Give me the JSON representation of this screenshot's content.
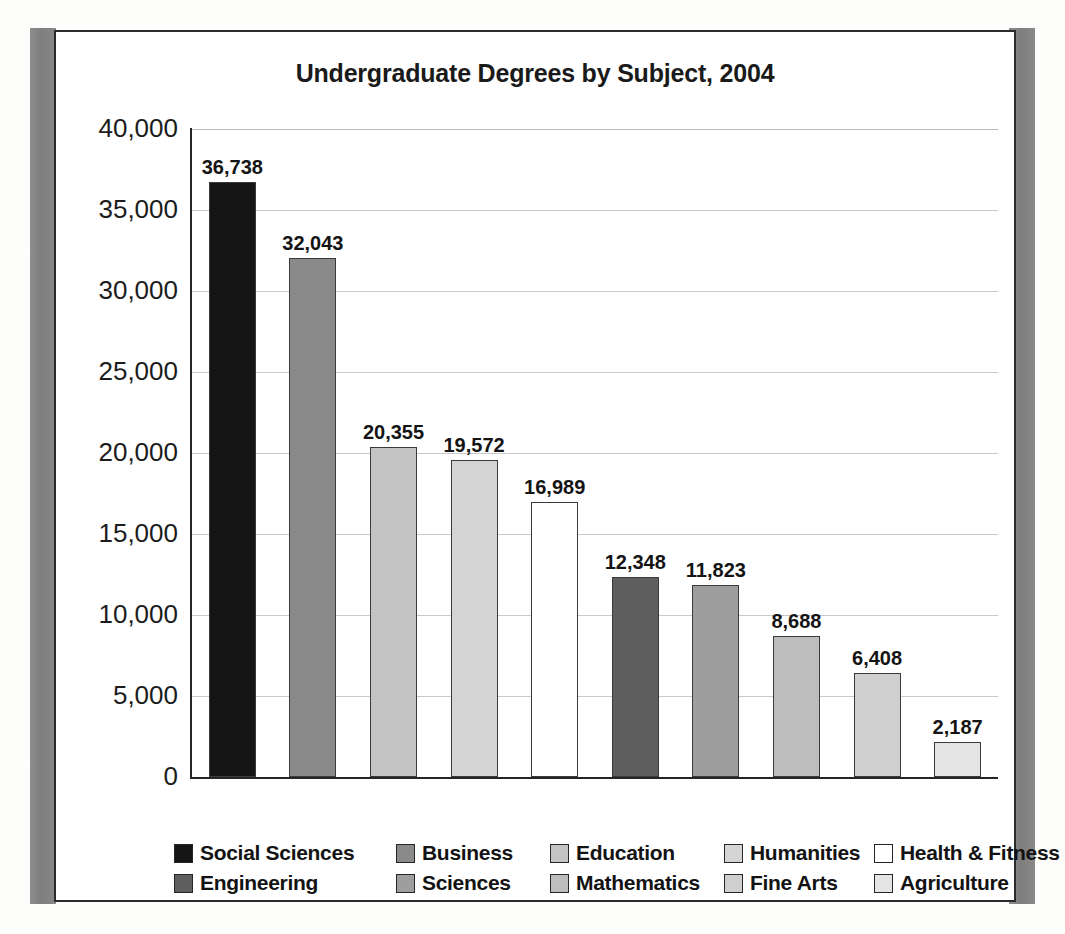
{
  "chart_data": {
    "type": "bar",
    "title": "Undergraduate Degrees by Subject, 2004",
    "xlabel": "",
    "ylabel": "",
    "ylim": [
      0,
      40000
    ],
    "ytick_labels": [
      "40,000",
      "35,000",
      "30,000",
      "25,000",
      "20,000",
      "15,000",
      "10,000",
      "5,000",
      "0"
    ],
    "ytick_values": [
      40000,
      35000,
      30000,
      25000,
      20000,
      15000,
      10000,
      5000,
      0
    ],
    "grid": true,
    "legend_position": "bottom",
    "categories": [
      "Social Sciences",
      "Business",
      "Education",
      "Humanities",
      "Health & Fitness",
      "Engineering",
      "Sciences",
      "Mathematics",
      "Fine Arts",
      "Agriculture"
    ],
    "values": [
      36738,
      32043,
      20355,
      19572,
      16989,
      12348,
      11823,
      8688,
      6408,
      2187
    ],
    "value_labels": [
      "36,738",
      "32,043",
      "20,355",
      "19,572",
      "16,989",
      "12,348",
      "11,823",
      "8,688",
      "6,408",
      "2,187"
    ],
    "colors": [
      "#151515",
      "#8a8a8a",
      "#c4c4c4",
      "#d4d4d4",
      "#ffffff",
      "#5e5e5e",
      "#9e9e9e",
      "#bdbdbd",
      "#cfcfcf",
      "#e4e4e4"
    ],
    "bars": [
      {
        "category": "Social Sciences",
        "value": 36738,
        "label": "36,738",
        "color": "#151515"
      },
      {
        "category": "Business",
        "value": 32043,
        "label": "32,043",
        "color": "#8a8a8a"
      },
      {
        "category": "Education",
        "value": 20355,
        "label": "20,355",
        "color": "#c4c4c4"
      },
      {
        "category": "Humanities",
        "value": 19572,
        "label": "19,572",
        "color": "#d4d4d4"
      },
      {
        "category": "Health & Fitness",
        "value": 16989,
        "label": "16,989",
        "color": "#ffffff"
      },
      {
        "category": "Engineering",
        "value": 12348,
        "label": "12,348",
        "color": "#5e5e5e"
      },
      {
        "category": "Sciences",
        "value": 11823,
        "label": "11,823",
        "color": "#9e9e9e"
      },
      {
        "category": "Mathematics",
        "value": 8688,
        "label": "8,688",
        "color": "#bdbdbd"
      },
      {
        "category": "Fine Arts",
        "value": 6408,
        "label": "6,408",
        "color": "#cfcfcf"
      },
      {
        "category": "Agriculture",
        "value": 2187,
        "label": "2,187",
        "color": "#e4e4e4"
      }
    ],
    "legend": [
      [
        {
          "label": "Social Sciences",
          "color": "#151515"
        },
        {
          "label": "Business",
          "color": "#8a8a8a"
        },
        {
          "label": "Education",
          "color": "#c4c4c4"
        },
        {
          "label": "Humanities",
          "color": "#d4d4d4"
        },
        {
          "label": "Health & Fitness",
          "color": "#ffffff"
        }
      ],
      [
        {
          "label": "Engineering",
          "color": "#5e5e5e"
        },
        {
          "label": "Sciences",
          "color": "#9e9e9e"
        },
        {
          "label": "Mathematics",
          "color": "#bdbdbd"
        },
        {
          "label": "Fine Arts",
          "color": "#cfcfcf"
        },
        {
          "label": "Agriculture",
          "color": "#e4e4e4"
        }
      ]
    ]
  }
}
